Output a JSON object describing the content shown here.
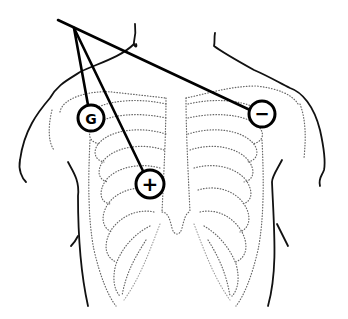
{
  "diagram": {
    "title": "",
    "colors": {
      "background": "#ffffff",
      "lines": "#000000",
      "ribs": "#666666"
    },
    "electrodes": [
      {
        "id": "ground",
        "label": "G",
        "cx": 91,
        "cy": 118,
        "r": 13
      },
      {
        "id": "positive",
        "label": "+",
        "cx": 150,
        "cy": 184,
        "r": 14
      },
      {
        "id": "negative",
        "label": "−",
        "cx": 262,
        "cy": 114,
        "r": 13
      }
    ],
    "lead_origin": {
      "x": 74,
      "y": 30
    }
  }
}
